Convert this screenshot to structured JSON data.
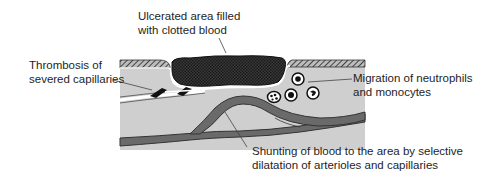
{
  "diagram": {
    "labels": {
      "ulcer": {
        "line1": "Ulcerated area filled",
        "line2": "with clotted blood"
      },
      "thrombosis": {
        "line1": "Thrombosis of",
        "line2": "severed capillaries"
      },
      "migration": {
        "line1": "Migration of neutrophils",
        "line2": "and monocytes"
      },
      "shunting": {
        "line1": "Shunting of blood to the area by selective",
        "line2": "dilatation of arterioles and capillaries"
      }
    },
    "colors": {
      "tissue": "#cfcfcf",
      "epidermis_hatch": "#555555",
      "clot": "#2a2a2a",
      "vessel": "#6a6a6a",
      "vessel_outline": "#333333",
      "cell_outline": "#1a1a1a",
      "text": "#1e1e1e",
      "background": "#ffffff"
    },
    "cells": [
      {
        "type": "monocyte",
        "cx": 298,
        "cy": 80
      },
      {
        "type": "neutrophil",
        "cx": 275,
        "cy": 97
      },
      {
        "type": "monocyte",
        "cx": 292,
        "cy": 95
      },
      {
        "type": "monocyte-kidney",
        "cx": 314,
        "cy": 94
      }
    ]
  }
}
